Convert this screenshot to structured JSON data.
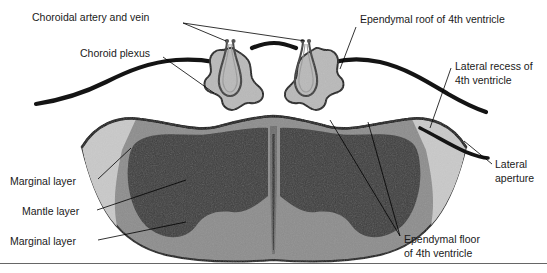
{
  "figure": {
    "title_cut_off": "",
    "labels": [
      {
        "id": "choroidal-artery-and-vein",
        "text": "Choroidal artery and vein",
        "x": 32,
        "y": 18,
        "anchor": "start"
      },
      {
        "id": "choroid-plexus",
        "text": "Choroid plexus",
        "x": 80,
        "y": 54,
        "anchor": "start"
      },
      {
        "id": "ependymal-roof-of-4th-ventricle",
        "text": "Ependymal roof of 4th ventricle",
        "x": 360,
        "y": 20,
        "anchor": "start"
      },
      {
        "id": "lateral-recess-of-4th-ventricle-line1",
        "text": "Lateral recess of",
        "x": 455,
        "y": 67,
        "anchor": "start"
      },
      {
        "id": "lateral-recess-of-4th-ventricle-line2",
        "text": "4th ventricle",
        "x": 455,
        "y": 81,
        "anchor": "start"
      },
      {
        "id": "lateral-aperture-line1",
        "text": "Lateral",
        "x": 495,
        "y": 165,
        "anchor": "start"
      },
      {
        "id": "lateral-aperture-line2",
        "text": "aperture",
        "x": 495,
        "y": 179,
        "anchor": "start"
      },
      {
        "id": "marginal-layer-upper",
        "text": "Marginal layer",
        "x": 10,
        "y": 182,
        "anchor": "start"
      },
      {
        "id": "mantle-layer",
        "text": "Mantle layer",
        "x": 22,
        "y": 212,
        "anchor": "start"
      },
      {
        "id": "marginal-layer-lower",
        "text": "Marginal layer",
        "x": 10,
        "y": 242,
        "anchor": "start"
      },
      {
        "id": "ependymal-floor-of-4th-ventricle-line1",
        "text": "Ependymal floor",
        "x": 404,
        "y": 240,
        "anchor": "start"
      },
      {
        "id": "ependymal-floor-of-4th-ventricle-line2",
        "text": "of 4th ventricle",
        "x": 404,
        "y": 254,
        "anchor": "start"
      }
    ],
    "colors": {
      "mantle_layer": "#3d3d3d",
      "marginal_layer": "#8d8d8d",
      "outer_light_wedge": "#c9c9c9",
      "choroid_plexus_fill": "#b9b9b9",
      "outline": "#141414",
      "background": "#ffffff",
      "label_text": "#1a1a1a",
      "rule": "#555555"
    },
    "structures": [
      {
        "id": "ependymal-roof",
        "kind": "thick-curve",
        "description": "thick dark band sweeping across the top of the figure"
      },
      {
        "id": "choroid-plexus-left",
        "kind": "tuft",
        "description": "lobulated gray tuft suspended from ependymal roof, left of midline"
      },
      {
        "id": "choroid-plexus-right",
        "kind": "tuft",
        "description": "lobulated gray tuft suspended from ependymal roof, right of midline"
      },
      {
        "id": "choroidal-vessels-left",
        "kind": "vessel-loop",
        "description": "paired artery and vein loop inside left tuft"
      },
      {
        "id": "choroidal-vessels-right",
        "kind": "vessel-loop",
        "description": "paired artery and vein loop inside right tuft"
      },
      {
        "id": "neural-tube-section",
        "kind": "cross-section",
        "description": "butterfly shaped brainstem/neural tube cross section"
      },
      {
        "id": "central-canal",
        "kind": "slit",
        "description": "narrow vertical midline canal"
      },
      {
        "id": "lateral-aperture-left",
        "kind": "opening",
        "description": "gap in ependymal roof at left lateral recess"
      },
      {
        "id": "lateral-aperture-right",
        "kind": "opening",
        "description": "gap in ependymal roof at right lateral recess"
      }
    ],
    "bottom_rule": true
  }
}
